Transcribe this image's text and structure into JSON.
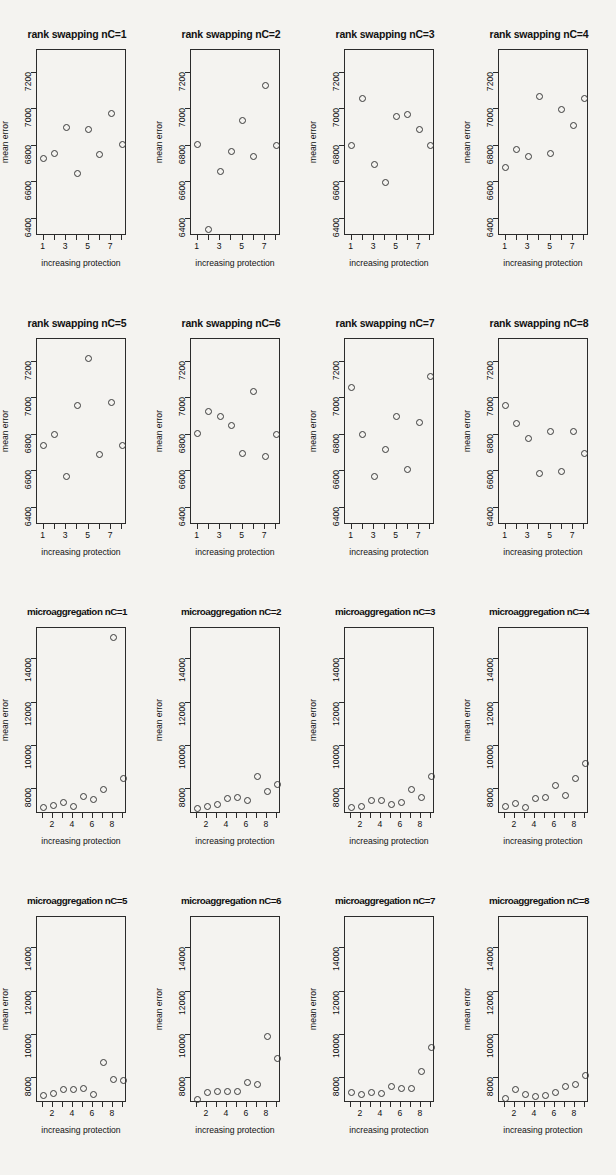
{
  "figure": {
    "background_color": "#f4f3f0",
    "point_color": "#3a3a3a",
    "axis_color": "#2b2b2b",
    "rows": 4,
    "columns": 4,
    "axis_labels": {
      "y": "mean error",
      "x": "increasing protection"
    }
  },
  "chart_data": [
    {
      "type": "scatter",
      "title": "rank swapping nC=1",
      "xlabel": "increasing protection",
      "ylabel": "mean error",
      "xlim": [
        0.5,
        8.5
      ],
      "ylim": [
        6300,
        7320
      ],
      "xticks": [
        1,
        2,
        3,
        4,
        5,
        6,
        7,
        8
      ],
      "xticklabels": [
        "1",
        "",
        "3",
        "",
        "5",
        "",
        "7",
        ""
      ],
      "yticks": [
        6400,
        6600,
        6800,
        7000,
        7200
      ],
      "grid": false,
      "x": [
        1,
        2,
        3,
        4,
        5,
        6,
        7,
        8
      ],
      "y": [
        6730,
        6760,
        6900,
        6650,
        6890,
        6750,
        6980,
        6810
      ]
    },
    {
      "type": "scatter",
      "title": "rank swapping nC=2",
      "xlabel": "increasing protection",
      "ylabel": "mean error",
      "xlim": [
        0.5,
        8.5
      ],
      "ylim": [
        6300,
        7320
      ],
      "xticks": [
        1,
        2,
        3,
        4,
        5,
        6,
        7,
        8
      ],
      "xticklabels": [
        "1",
        "",
        "3",
        "",
        "5",
        "",
        "7",
        ""
      ],
      "yticks": [
        6400,
        6600,
        6800,
        7000,
        7200
      ],
      "grid": false,
      "x": [
        1,
        2,
        3,
        4,
        5,
        6,
        7,
        8
      ],
      "y": [
        6810,
        6340,
        6660,
        6770,
        6940,
        6740,
        7130,
        6800
      ]
    },
    {
      "type": "scatter",
      "title": "rank swapping nC=3",
      "xlabel": "increasing protection",
      "ylabel": "mean error",
      "xlim": [
        0.5,
        8.5
      ],
      "ylim": [
        6300,
        7320
      ],
      "xticks": [
        1,
        2,
        3,
        4,
        5,
        6,
        7,
        8
      ],
      "xticklabels": [
        "1",
        "",
        "3",
        "",
        "5",
        "",
        "7",
        ""
      ],
      "yticks": [
        6400,
        6600,
        6800,
        7000,
        7200
      ],
      "grid": false,
      "x": [
        1,
        2,
        3,
        4,
        5,
        6,
        7,
        8
      ],
      "y": [
        6800,
        7060,
        6700,
        6600,
        6960,
        6970,
        6890,
        6800
      ]
    },
    {
      "type": "scatter",
      "title": "rank swapping nC=4",
      "xlabel": "increasing protection",
      "ylabel": "mean error",
      "xlim": [
        0.5,
        8.5
      ],
      "ylim": [
        6300,
        7320
      ],
      "xticks": [
        1,
        2,
        3,
        4,
        5,
        6,
        7,
        8
      ],
      "xticklabels": [
        "1",
        "",
        "3",
        "",
        "5",
        "",
        "7",
        ""
      ],
      "yticks": [
        6400,
        6600,
        6800,
        7000,
        7200
      ],
      "grid": false,
      "x": [
        1,
        2,
        3,
        4,
        5,
        6,
        7,
        8
      ],
      "y": [
        6680,
        6780,
        6740,
        7070,
        6760,
        7000,
        6910,
        7060
      ]
    },
    {
      "type": "scatter",
      "title": "rank swapping nC=5",
      "xlabel": "increasing protection",
      "ylabel": "mean error",
      "xlim": [
        0.5,
        8.5
      ],
      "ylim": [
        6300,
        7320
      ],
      "xticks": [
        1,
        2,
        3,
        4,
        5,
        6,
        7,
        8
      ],
      "xticklabels": [
        "1",
        "",
        "3",
        "",
        "5",
        "",
        "7",
        ""
      ],
      "yticks": [
        6400,
        6600,
        6800,
        7000,
        7200
      ],
      "grid": false,
      "x": [
        1,
        2,
        3,
        4,
        5,
        6,
        7,
        8
      ],
      "y": [
        6740,
        6800,
        6570,
        6960,
        7220,
        6690,
        6980,
        6740
      ]
    },
    {
      "type": "scatter",
      "title": "rank swapping nC=6",
      "xlabel": "increasing protection",
      "ylabel": "mean error",
      "xlim": [
        0.5,
        8.5
      ],
      "ylim": [
        6300,
        7320
      ],
      "xticks": [
        1,
        2,
        3,
        4,
        5,
        6,
        7,
        8
      ],
      "xticklabels": [
        "1",
        "",
        "3",
        "",
        "5",
        "",
        "7",
        ""
      ],
      "yticks": [
        6400,
        6600,
        6800,
        7000,
        7200
      ],
      "grid": false,
      "x": [
        1,
        2,
        3,
        4,
        5,
        6,
        7,
        8
      ],
      "y": [
        6810,
        6930,
        6900,
        6850,
        6700,
        7040,
        6680,
        6800
      ]
    },
    {
      "type": "scatter",
      "title": "rank swapping nC=7",
      "xlabel": "increasing protection",
      "ylabel": "mean error",
      "xlim": [
        0.5,
        8.5
      ],
      "ylim": [
        6300,
        7320
      ],
      "xticks": [
        1,
        2,
        3,
        4,
        5,
        6,
        7,
        8
      ],
      "xticklabels": [
        "1",
        "",
        "3",
        "",
        "5",
        "",
        "7",
        ""
      ],
      "yticks": [
        6400,
        6600,
        6800,
        7000,
        7200
      ],
      "grid": false,
      "x": [
        1,
        2,
        3,
        4,
        5,
        6,
        7,
        8
      ],
      "y": [
        7060,
        6800,
        6570,
        6720,
        6900,
        6610,
        6870,
        7120
      ]
    },
    {
      "type": "scatter",
      "title": "rank swapping nC=8",
      "xlabel": "increasing protection",
      "ylabel": "mean error",
      "xlim": [
        0.5,
        8.5
      ],
      "ylim": [
        6300,
        7320
      ],
      "xticks": [
        1,
        2,
        3,
        4,
        5,
        6,
        7,
        8
      ],
      "xticklabels": [
        "1",
        "",
        "3",
        "",
        "5",
        "",
        "7",
        ""
      ],
      "yticks": [
        6400,
        6600,
        6800,
        7000,
        7200
      ],
      "grid": false,
      "x": [
        1,
        2,
        3,
        4,
        5,
        6,
        7,
        8
      ],
      "y": [
        6960,
        6860,
        6780,
        6590,
        6820,
        6600,
        6820,
        6700
      ]
    },
    {
      "type": "scatter",
      "title": "microaggregation nC=1",
      "xlabel": "increasing protection",
      "ylabel": "mean error",
      "xlim": [
        0.5,
        9.5
      ],
      "ylim": [
        6800,
        15400
      ],
      "xticks": [
        1,
        2,
        3,
        4,
        5,
        6,
        7,
        8,
        9
      ],
      "xticklabels": [
        "",
        "2",
        "",
        "4",
        "",
        "6",
        "",
        "8",
        ""
      ],
      "yticks": [
        8000,
        10000,
        12000,
        14000
      ],
      "grid": false,
      "x": [
        1,
        2,
        3,
        4,
        5,
        6,
        7,
        8,
        9
      ],
      "y": [
        7150,
        7250,
        7400,
        7200,
        7650,
        7500,
        8000,
        15000,
        8500
      ]
    },
    {
      "type": "scatter",
      "title": "microaggregation nC=2",
      "xlabel": "increasing protection",
      "ylabel": "mean error",
      "xlim": [
        0.5,
        9.5
      ],
      "ylim": [
        6800,
        15400
      ],
      "xticks": [
        1,
        2,
        3,
        4,
        5,
        6,
        7,
        8,
        9
      ],
      "xticklabels": [
        "",
        "2",
        "",
        "4",
        "",
        "6",
        "",
        "8",
        ""
      ],
      "yticks": [
        8000,
        10000,
        12000,
        14000
      ],
      "grid": false,
      "x": [
        1,
        2,
        3,
        4,
        5,
        6,
        7,
        8,
        9
      ],
      "y": [
        7100,
        7200,
        7300,
        7550,
        7600,
        7450,
        8600,
        7900,
        8200
      ]
    },
    {
      "type": "scatter",
      "title": "microaggregation nC=3",
      "xlabel": "increasing protection",
      "ylabel": "mean error",
      "xlim": [
        0.5,
        9.5
      ],
      "ylim": [
        6800,
        15400
      ],
      "xticks": [
        1,
        2,
        3,
        4,
        5,
        6,
        7,
        8,
        9
      ],
      "xticklabels": [
        "",
        "2",
        "",
        "4",
        "",
        "6",
        "",
        "8",
        ""
      ],
      "yticks": [
        8000,
        10000,
        12000,
        14000
      ],
      "grid": false,
      "x": [
        1,
        2,
        3,
        4,
        5,
        6,
        7,
        8,
        9
      ],
      "y": [
        7150,
        7200,
        7450,
        7450,
        7300,
        7400,
        8000,
        7600,
        8600
      ]
    },
    {
      "type": "scatter",
      "title": "microaggregation nC=4",
      "xlabel": "increasing protection",
      "ylabel": "mean error",
      "xlim": [
        0.5,
        9.5
      ],
      "ylim": [
        6800,
        15400
      ],
      "xticks": [
        1,
        2,
        3,
        4,
        5,
        6,
        7,
        8,
        9
      ],
      "xticklabels": [
        "",
        "2",
        "",
        "4",
        "",
        "6",
        "",
        "8",
        ""
      ],
      "yticks": [
        8000,
        10000,
        12000,
        14000
      ],
      "grid": false,
      "x": [
        1,
        2,
        3,
        4,
        5,
        6,
        7,
        8,
        9
      ],
      "y": [
        7200,
        7350,
        7150,
        7550,
        7600,
        8150,
        7700,
        8500,
        9200
      ]
    },
    {
      "type": "scatter",
      "title": "microaggregation nC=5",
      "xlabel": "increasing protection",
      "ylabel": "mean error",
      "xlim": [
        0.5,
        9.5
      ],
      "ylim": [
        6800,
        15400
      ],
      "xticks": [
        1,
        2,
        3,
        4,
        5,
        6,
        7,
        8,
        9
      ],
      "xticklabels": [
        "",
        "2",
        "",
        "4",
        "",
        "6",
        "",
        "8",
        ""
      ],
      "yticks": [
        8000,
        10000,
        12000,
        14000
      ],
      "grid": false,
      "x": [
        1,
        2,
        3,
        4,
        5,
        6,
        7,
        8,
        9
      ],
      "y": [
        7200,
        7300,
        7450,
        7450,
        7500,
        7250,
        8700,
        7950,
        7900
      ]
    },
    {
      "type": "scatter",
      "title": "microaggregation nC=6",
      "xlabel": "increasing protection",
      "ylabel": "mean error",
      "xlim": [
        0.5,
        9.5
      ],
      "ylim": [
        6800,
        15400
      ],
      "xticks": [
        1,
        2,
        3,
        4,
        5,
        6,
        7,
        8,
        9
      ],
      "xticklabels": [
        "",
        "2",
        "",
        "4",
        "",
        "6",
        "",
        "8",
        ""
      ],
      "yticks": [
        8000,
        10000,
        12000,
        14000
      ],
      "grid": false,
      "x": [
        1,
        2,
        3,
        4,
        5,
        6,
        7,
        8,
        9
      ],
      "y": [
        7000,
        7350,
        7400,
        7400,
        7400,
        7800,
        7700,
        9900,
        8900
      ]
    },
    {
      "type": "scatter",
      "title": "microaggregation nC=7",
      "xlabel": "increasing protection",
      "ylabel": "mean error",
      "xlim": [
        0.5,
        9.5
      ],
      "ylim": [
        6800,
        15400
      ],
      "xticks": [
        1,
        2,
        3,
        4,
        5,
        6,
        7,
        8,
        9
      ],
      "xticklabels": [
        "",
        "2",
        "",
        "4",
        "",
        "6",
        "",
        "8",
        ""
      ],
      "yticks": [
        8000,
        10000,
        12000,
        14000
      ],
      "grid": false,
      "x": [
        1,
        2,
        3,
        4,
        5,
        6,
        7,
        8,
        9
      ],
      "y": [
        7350,
        7250,
        7350,
        7300,
        7600,
        7500,
        7500,
        8300,
        9400
      ]
    },
    {
      "type": "scatter",
      "title": "microaggregation nC=8",
      "xlabel": "increasing protection",
      "ylabel": "mean error",
      "xlim": [
        0.5,
        9.5
      ],
      "ylim": [
        6800,
        15400
      ],
      "xticks": [
        1,
        2,
        3,
        4,
        5,
        6,
        7,
        8,
        9
      ],
      "xticklabels": [
        "",
        "2",
        "",
        "4",
        "",
        "6",
        "",
        "8",
        ""
      ],
      "yticks": [
        8000,
        10000,
        12000,
        14000
      ],
      "grid": false,
      "x": [
        1,
        2,
        3,
        4,
        5,
        6,
        7,
        8,
        9
      ],
      "y": [
        7050,
        7450,
        7250,
        7150,
        7200,
        7350,
        7600,
        7700,
        8100
      ]
    }
  ]
}
